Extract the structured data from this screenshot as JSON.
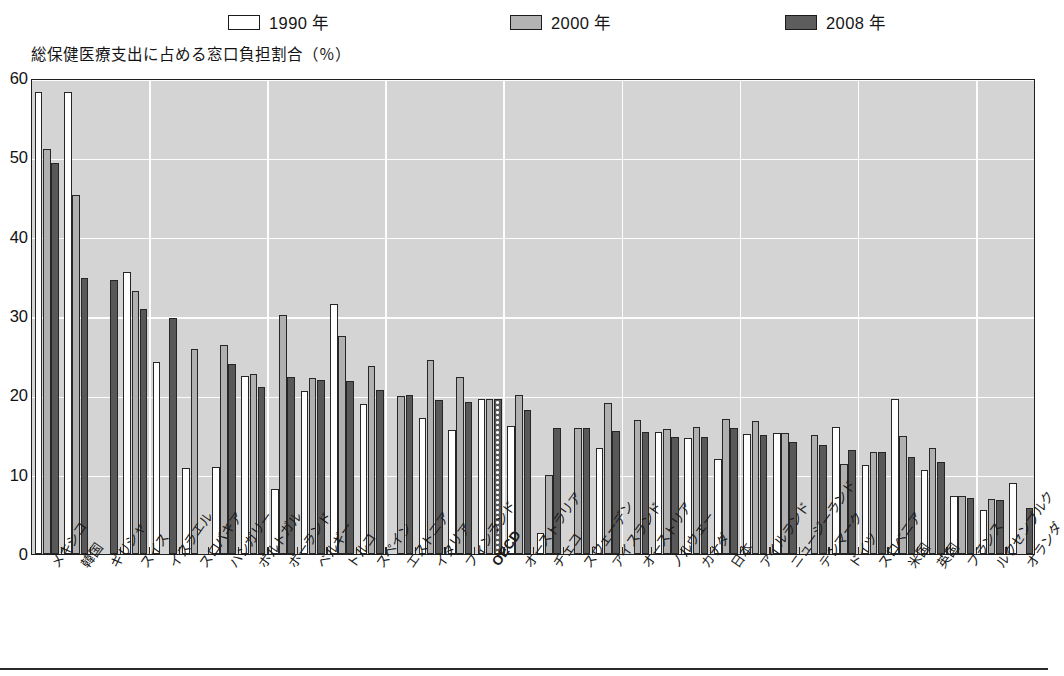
{
  "legend": {
    "items": [
      {
        "label": "1990 年",
        "swatch": "white-swatch",
        "color": "#ffffff"
      },
      {
        "label": "2000 年",
        "swatch": "light-gray-swatch",
        "color": "#b4b4b4"
      },
      {
        "label": "2008 年",
        "swatch": "dark-gray-swatch",
        "color": "#5d5d5d"
      }
    ]
  },
  "axis_title": "総保健医療支出に占める窓口負担割合（％）",
  "chart_data": {
    "type": "bar",
    "title": "総保健医療支出に占める窓口負担割合（％）",
    "xlabel": "",
    "ylabel": "総保健医療支出に占める窓口負担割合（％）",
    "ylim": [
      0,
      60
    ],
    "yticks": [
      0,
      10,
      20,
      30,
      40,
      50,
      60
    ],
    "ytick_labels": [
      "0",
      "10",
      "20",
      "30",
      "40",
      "50",
      "60"
    ],
    "grid": true,
    "legend_position": "top",
    "legend": [
      "1990 年",
      "2000 年",
      "2008 年"
    ],
    "highlight_category": "OECD",
    "categories": [
      "メキシコ",
      "韓国",
      "ギリシャ",
      "スイス",
      "イスラエル",
      "スロバキア",
      "ハンガリー",
      "ポルトガル",
      "ポーランド",
      "ベルギー",
      "トルコ",
      "スペイン",
      "エストニア",
      "イタリア",
      "フィンランド",
      "OECD",
      "オーストラリア",
      "チェコ",
      "スウェーデン",
      "アイスランド",
      "オーストリア",
      "ノルウェー",
      "カナダ",
      "日本",
      "アイルランド",
      "ニュージーランド",
      "デンマーク",
      "ドイツ",
      "スロベニア",
      "米国",
      "英国",
      "フランス",
      "ルクセンブルク",
      "オランダ"
    ],
    "series": [
      {
        "name": "1990 年",
        "values": [
          58.2,
          58.3,
          null,
          35.6,
          24.2,
          10.9,
          11.0,
          22.4,
          8.2,
          20.6,
          31.5,
          18.9,
          null,
          17.1,
          15.6,
          19.6,
          16.1,
          2.7,
          null,
          13.4,
          null,
          15.4,
          14.6,
          12.0,
          15.1,
          15.2,
          null,
          16.0,
          11.2,
          19.5,
          10.6,
          7.3,
          5.5,
          9.0
        ]
      },
      {
        "name": "2000 年",
        "values": [
          51.0,
          45.3,
          null,
          33.2,
          null,
          25.8,
          26.3,
          22.7,
          30.1,
          22.2,
          27.5,
          23.7,
          19.9,
          24.5,
          22.3,
          19.6,
          20.1,
          10.0,
          15.9,
          19.0,
          16.9,
          15.8,
          16.0,
          17.0,
          16.8,
          15.3,
          15.0,
          11.4,
          12.8,
          14.9,
          13.4,
          7.3,
          6.9,
          null
        ]
      },
      {
        "name": "2008 年",
        "values": [
          49.3,
          34.8,
          34.5,
          30.9,
          29.8,
          null,
          23.9,
          21.1,
          22.3,
          21.9,
          21.8,
          20.7,
          20.1,
          19.4,
          19.2,
          19.5,
          18.1,
          15.9,
          15.9,
          15.5,
          15.4,
          14.8,
          14.7,
          15.9,
          15.0,
          14.1,
          13.8,
          13.1,
          12.8,
          12.2,
          11.6,
          7.1,
          6.8,
          5.8
        ]
      }
    ]
  }
}
